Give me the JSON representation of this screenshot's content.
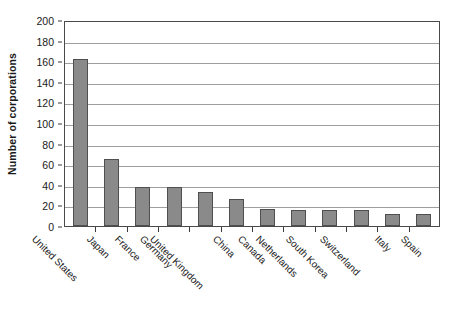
{
  "chart_data": {
    "type": "bar",
    "title": "",
    "subtitle": "",
    "xlabel": "",
    "ylabel": "Number of corporations",
    "ylim": [
      0,
      200
    ],
    "ytick_step": 20,
    "yticks": [
      0,
      20,
      40,
      60,
      80,
      100,
      120,
      140,
      160,
      180,
      200
    ],
    "grid": true,
    "legend": false,
    "orientation": "vertical",
    "categories": [
      "United States",
      "Japan",
      "France",
      "Germany",
      "United Kingdom",
      "China",
      "Canada",
      "Netherlands",
      "South Korea",
      "Switzerland",
      "Italy",
      "Spain"
    ],
    "values": [
      162,
      65,
      38,
      38,
      33,
      26,
      17,
      16,
      16,
      16,
      12,
      12
    ],
    "series": [
      {
        "name": "Number of corporations",
        "values": [
          162,
          65,
          38,
          38,
          33,
          26,
          17,
          16,
          16,
          16,
          12,
          12
        ]
      }
    ],
    "annotations": []
  },
  "style": {
    "bar_fill": "#8a8a8a",
    "bar_border": "#4f4f4f",
    "gridline_color": "#9e9e9e",
    "frame_color": "#4a4a4a",
    "background": "#ffffff",
    "text_color": "#1a1a1a"
  }
}
